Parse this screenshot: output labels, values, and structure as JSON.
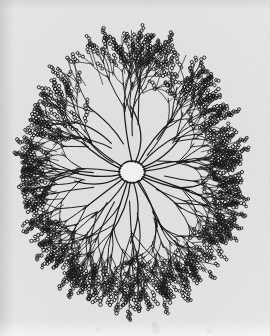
{
  "figure": {
    "subject_name": "dendritic-arbor",
    "caption": "",
    "medium": "halftone line engraving on textured paper",
    "plate_width": 270,
    "plate_height": 336
  },
  "canvas": {
    "width": 270,
    "height": 336,
    "background_color": "#e7e7e7",
    "paper_edge_color": "#ffffff",
    "ink_color": "#1a1a1a"
  },
  "structure": {
    "type": "radial-dendritic-arbor",
    "center_x": 132,
    "center_y": 172,
    "radius_x": 112,
    "radius_y": 142,
    "outline_shape": "oval",
    "hub_label": "soma",
    "hub_radius_x": 13,
    "hub_radius_y": 11,
    "primary_branch_count": 22,
    "branch_generations": 4,
    "terminal_bead_chains": true,
    "bead_radius": 1.6,
    "stroke_width_primary": 1.25,
    "stroke_width_terminal": 0.7,
    "fill_density": "dense"
  },
  "chart_data": {
    "type": "scatter",
    "xlabel": "",
    "ylabel": "",
    "center": [
      132,
      172
    ],
    "extent_x": [
      28,
      254
    ],
    "extent_y": [
      32,
      314
    ],
    "primary_ray_angles_deg": [
      -90,
      -74,
      -58,
      -44,
      -30,
      -16,
      -2,
      12,
      26,
      40,
      54,
      68,
      82,
      96,
      110,
      124,
      138,
      152,
      166,
      182,
      198,
      214
    ],
    "primary_ray_lengths": [
      128,
      124,
      131,
      120,
      126,
      116,
      124,
      130,
      122,
      127,
      118,
      125,
      132,
      121,
      129,
      117,
      126,
      123,
      130,
      119,
      127,
      124
    ],
    "generations": 4,
    "branch_angle_spread_deg": 26,
    "length_decay": 0.58,
    "terminal_bead_count_range": [
      3,
      9
    ],
    "legend": [],
    "grid": false
  },
  "margin_artifacts": [
    {
      "name": "smudge-lower-center",
      "x": 152,
      "y": 322,
      "w": 7,
      "h": 12,
      "rotate": -12
    },
    {
      "name": "smudge-lower-left",
      "x": 96,
      "y": 327,
      "w": 5,
      "h": 5,
      "rotate": 0
    },
    {
      "name": "smudge-lower-right",
      "x": 206,
      "y": 329,
      "w": 6,
      "h": 4,
      "rotate": 8
    }
  ]
}
